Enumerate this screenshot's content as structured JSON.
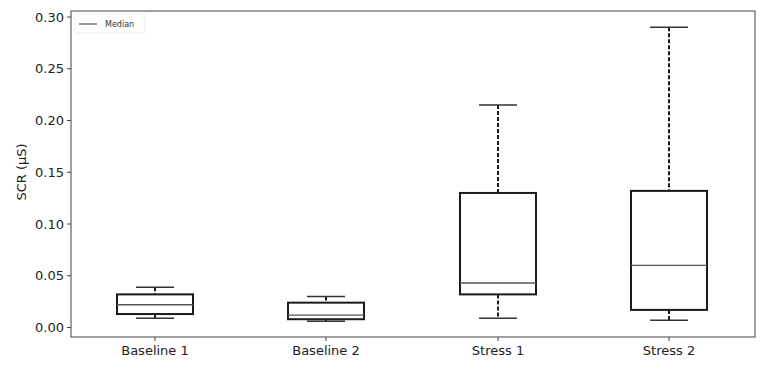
{
  "chart_data": {
    "type": "box",
    "title": "",
    "xlabel": "",
    "ylabel": "SCR (µS)",
    "ylim": [
      0.0,
      0.3
    ],
    "yticks": [
      "0.00",
      "0.05",
      "0.10",
      "0.15",
      "0.20",
      "0.25",
      "0.30"
    ],
    "grid": false,
    "legend": {
      "position": "upper left",
      "entries": [
        "Median"
      ]
    },
    "categories": [
      "Baseline 1",
      "Baseline 2",
      "Stress 1",
      "Stress 2"
    ],
    "series": [
      {
        "name": "Baseline 1",
        "whisker_low": 0.009,
        "q1": 0.013,
        "median": 0.022,
        "q3": 0.032,
        "whisker_high": 0.039
      },
      {
        "name": "Baseline 2",
        "whisker_low": 0.006,
        "q1": 0.008,
        "median": 0.012,
        "q3": 0.024,
        "whisker_high": 0.03
      },
      {
        "name": "Stress 1",
        "whisker_low": 0.009,
        "q1": 0.032,
        "median": 0.043,
        "q3": 0.13,
        "whisker_high": 0.215
      },
      {
        "name": "Stress 2",
        "whisker_low": 0.007,
        "q1": 0.017,
        "median": 0.06,
        "q3": 0.132,
        "whisker_high": 0.29
      }
    ],
    "colors": {
      "box": "#1a1a1a",
      "median": "#555555",
      "axes": "#444444"
    }
  }
}
